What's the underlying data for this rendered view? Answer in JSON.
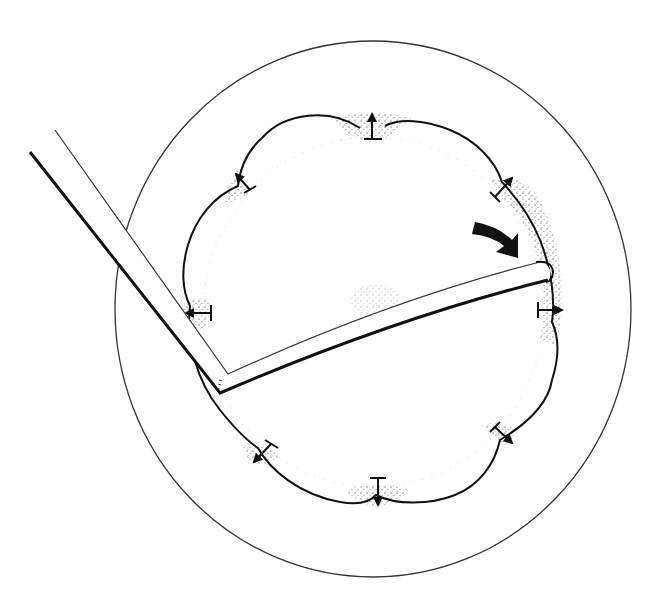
{
  "diagram": {
    "canvas": {
      "width": 662,
      "height": 601,
      "background": "#ffffff"
    },
    "colors": {
      "ink": "#111111",
      "thin_line": "#333333",
      "stipple": "#555555",
      "faint_dots": "#bbbbbb"
    },
    "outer_boundary": {
      "shape": "ellipse",
      "cx": 373,
      "cy": 309,
      "rx": 258,
      "ry": 268
    },
    "scalloped_cavity": {
      "center": [
        373,
        312
      ],
      "lobe_count": 8,
      "description": "eight convex lobes separated by cusps, each cusp marked with an outward arrow"
    },
    "expansion_arrows": [
      {
        "id": "top",
        "x": 372,
        "y": 120,
        "angle": -90
      },
      {
        "id": "top-right",
        "x": 503,
        "y": 188,
        "angle": -45
      },
      {
        "id": "right",
        "x": 548,
        "y": 310,
        "angle": 0
      },
      {
        "id": "bottom-right",
        "x": 503,
        "y": 437,
        "angle": 45
      },
      {
        "id": "bottom",
        "x": 378,
        "y": 492,
        "angle": 90
      },
      {
        "id": "bottom-left",
        "x": 262,
        "y": 455,
        "angle": 135
      },
      {
        "id": "left",
        "x": 196,
        "y": 313,
        "angle": 180
      },
      {
        "id": "top-left",
        "x": 242,
        "y": 182,
        "angle": -135
      }
    ],
    "tool": {
      "description": "bent L-shaped probe entering from upper left, tip touching right wall of cavity",
      "handle_start": [
        30,
        152
      ],
      "elbow": [
        218,
        388
      ],
      "tip": [
        548,
        272
      ]
    },
    "rotation_arrow": {
      "description": "bold curved arrow indicating sweeping motion of tool tip",
      "position": [
        495,
        232
      ]
    }
  }
}
